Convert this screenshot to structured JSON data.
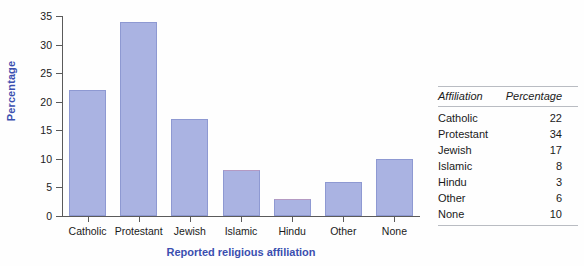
{
  "chart_data": {
    "type": "bar",
    "title": "",
    "xlabel": "Reported religious affiliation",
    "ylabel": "Percentage",
    "categories": [
      "Catholic",
      "Protestant",
      "Jewish",
      "Islamic",
      "Hindu",
      "Other",
      "None"
    ],
    "values": [
      22,
      34,
      17,
      8,
      3,
      6,
      10
    ],
    "ylim": [
      0,
      35
    ],
    "yticks": [
      0,
      5,
      10,
      15,
      20,
      25,
      30,
      35
    ],
    "ytick_labels": [
      "0",
      "5",
      "10",
      "15",
      "20",
      "25",
      "30",
      "35"
    ],
    "grid": false,
    "legend": "none",
    "bar_color": "#aab3e2",
    "bar_border_color": "#8e99d2",
    "axis_title_color": "#3b4fb0"
  },
  "table": {
    "headers": [
      "Affiliation",
      "Percentage"
    ],
    "rows": [
      [
        "Catholic",
        "22"
      ],
      [
        "Protestant",
        "34"
      ],
      [
        "Jewish",
        "17"
      ],
      [
        "Islamic",
        "8"
      ],
      [
        "Hindu",
        "3"
      ],
      [
        "Other",
        "6"
      ],
      [
        "None",
        "10"
      ]
    ]
  }
}
